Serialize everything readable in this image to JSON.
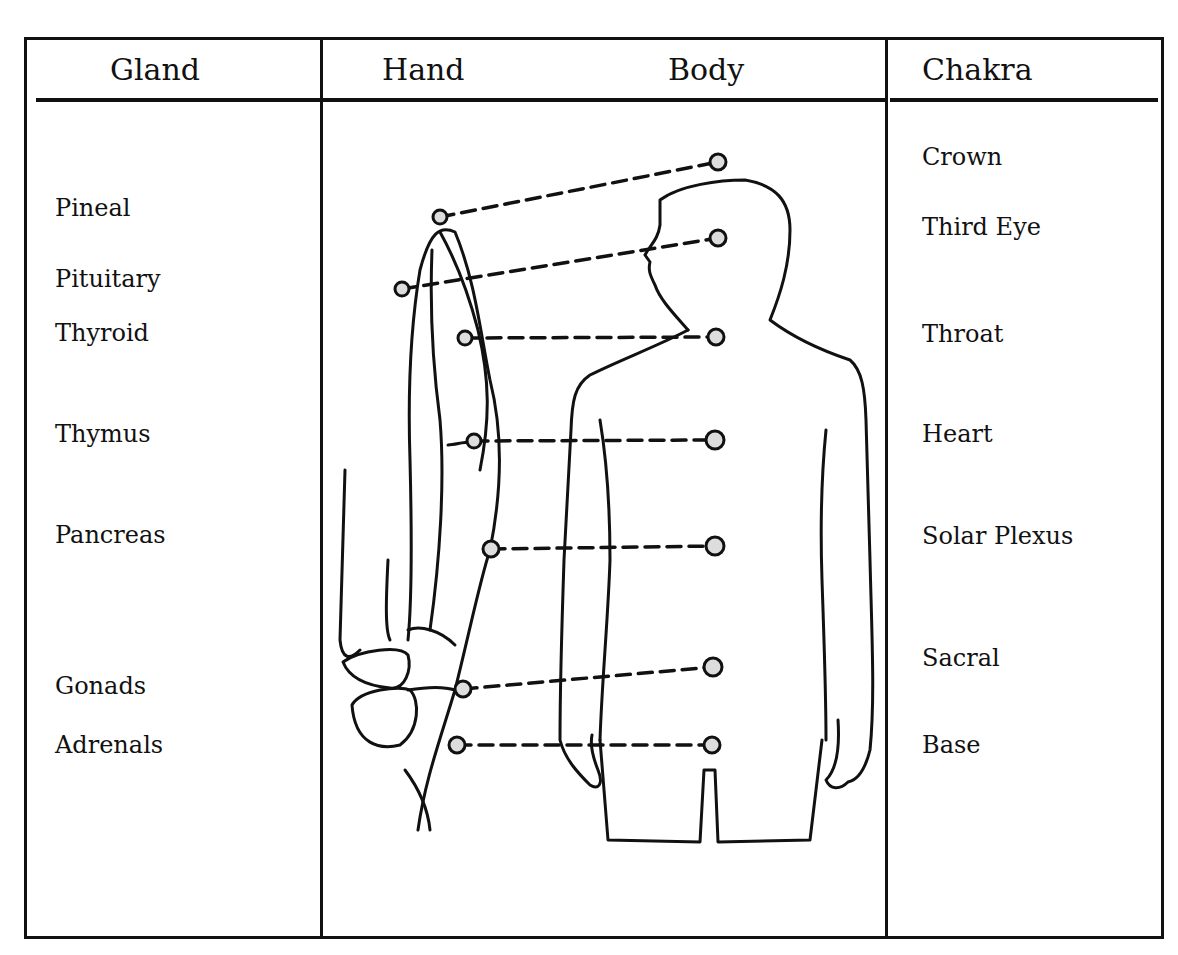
{
  "headers": {
    "gland": "Gland",
    "hand": "Hand",
    "body": "Body",
    "chakra": "Chakra"
  },
  "glands": [
    {
      "label": "Pineal",
      "y": 208
    },
    {
      "label": "Pituitary",
      "y": 279
    },
    {
      "label": "Thyroid",
      "y": 333
    },
    {
      "label": "Thymus",
      "y": 434
    },
    {
      "label": "Pancreas",
      "y": 535
    },
    {
      "label": "Gonads",
      "y": 686
    },
    {
      "label": "Adrenals",
      "y": 745
    }
  ],
  "chakras": [
    {
      "label": "Crown",
      "y": 157
    },
    {
      "label": "Third Eye",
      "y": 227
    },
    {
      "label": "Throat",
      "y": 334
    },
    {
      "label": "Heart",
      "y": 434
    },
    {
      "label": "Solar Plexus",
      "y": 536
    },
    {
      "label": "Sacral",
      "y": 658
    },
    {
      "label": "Base",
      "y": 745
    }
  ],
  "connections": [
    {
      "gland": "Pineal",
      "chakra": "Crown",
      "hand_point": [
        440,
        217
      ],
      "body_point": [
        718,
        162
      ]
    },
    {
      "gland": "Pituitary",
      "chakra": "Third Eye",
      "hand_point": [
        402,
        289
      ],
      "body_point": [
        718,
        238
      ]
    },
    {
      "gland": "Thyroid",
      "chakra": "Throat",
      "hand_point": [
        465,
        338
      ],
      "body_point": [
        716,
        337
      ]
    },
    {
      "gland": "Thymus",
      "chakra": "Heart",
      "hand_point": [
        474,
        441
      ],
      "body_point": [
        715,
        440
      ]
    },
    {
      "gland": "Pancreas",
      "chakra": "Solar Plexus",
      "hand_point": [
        491,
        549
      ],
      "body_point": [
        715,
        546
      ]
    },
    {
      "gland": "Gonads",
      "chakra": "Sacral",
      "hand_point": [
        463,
        689
      ],
      "body_point": [
        713,
        667
      ]
    },
    {
      "gland": "Adrenals",
      "chakra": "Base",
      "hand_point": [
        457,
        745
      ],
      "body_point": [
        712,
        745
      ]
    }
  ]
}
